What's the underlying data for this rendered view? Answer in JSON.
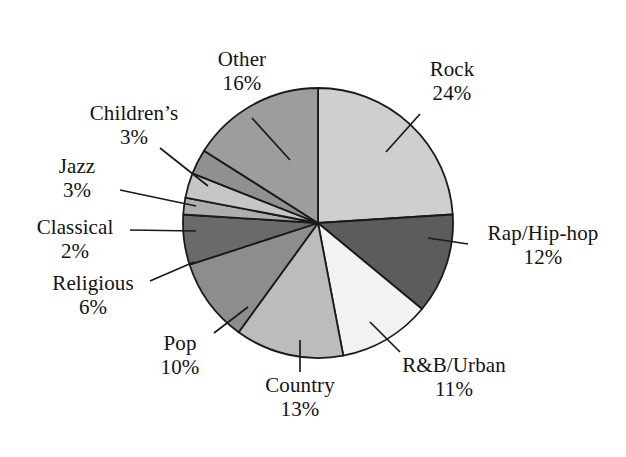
{
  "chart_data": {
    "type": "pie",
    "title": "",
    "xlabel": "",
    "ylabel": "",
    "legend_position": "none",
    "grid": false,
    "labels_show_percent": true,
    "total_percent": 100,
    "start_angle_deg": 0,
    "direction": "clockwise",
    "categories": [
      "Rock",
      "Rap/Hip-hop",
      "R&B/Urban",
      "Country",
      "Pop",
      "Religious",
      "Classical",
      "Jazz",
      "Children's",
      "Other"
    ],
    "values": [
      24,
      12,
      11,
      13,
      10,
      6,
      2,
      3,
      3,
      16
    ],
    "slices": [
      {
        "label": "Rock",
        "percent": 24,
        "percent_text": "24%",
        "color": "#cfcfcf"
      },
      {
        "label": "Rap/Hip-hop",
        "percent": 12,
        "percent_text": "12%",
        "color": "#5c5c5c"
      },
      {
        "label": "R&B/Urban",
        "percent": 11,
        "percent_text": "11%",
        "color": "#f2f2f2"
      },
      {
        "label": "Country",
        "percent": 13,
        "percent_text": "13%",
        "color": "#bcbcbc"
      },
      {
        "label": "Pop",
        "percent": 10,
        "percent_text": "10%",
        "color": "#8d8d8d"
      },
      {
        "label": "Religious",
        "percent": 6,
        "percent_text": "6%",
        "color": "#6a6a6a"
      },
      {
        "label": "Classical",
        "percent": 2,
        "percent_text": "2%",
        "color": "#aeaeae"
      },
      {
        "label": "Jazz",
        "percent": 3,
        "percent_text": "3%",
        "color": "#c6c6c6"
      },
      {
        "label": "Children's",
        "percent": 3,
        "percent_text": "3%",
        "color": "#909090"
      },
      {
        "label": "Other",
        "percent": 16,
        "percent_text": "16%",
        "color": "#9d9d9d"
      }
    ],
    "outline_color": "#1a1a1a",
    "background_color": "#ffffff"
  },
  "labels": {
    "other": {
      "name": "Other",
      "pct": "16%"
    },
    "childrens": {
      "name": "Children’s",
      "pct": "3%"
    },
    "jazz": {
      "name": "Jazz",
      "pct": "3%"
    },
    "classical": {
      "name": "Classical",
      "pct": "2%"
    },
    "religious": {
      "name": "Religious",
      "pct": "6%"
    },
    "pop": {
      "name": "Pop",
      "pct": "10%"
    },
    "country": {
      "name": "Country",
      "pct": "13%"
    },
    "rnb": {
      "name": "R&B/Urban",
      "pct": "11%"
    },
    "rap": {
      "name": "Rap/Hip-hop",
      "pct": "12%"
    },
    "rock": {
      "name": "Rock",
      "pct": "24%"
    }
  }
}
